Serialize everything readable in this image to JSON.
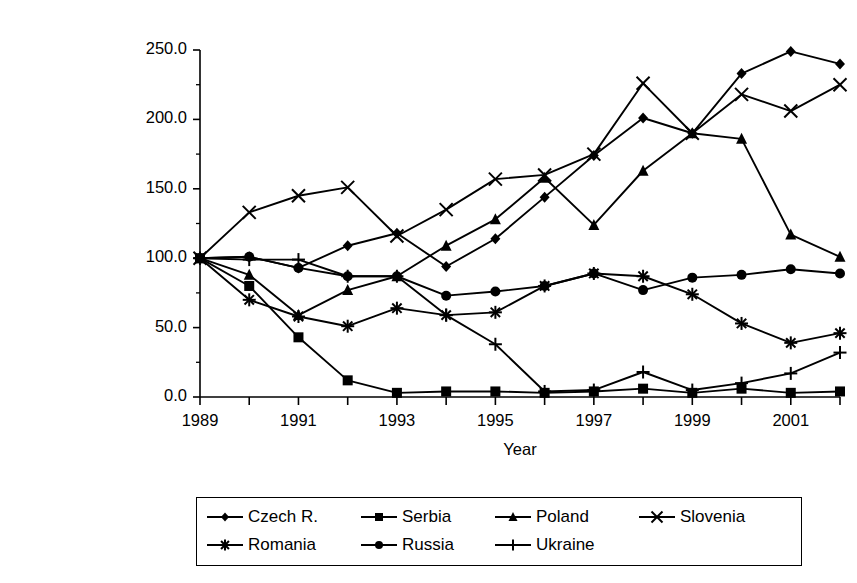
{
  "chart_data": {
    "type": "line",
    "title": "",
    "xlabel": "Year",
    "ylabel": "Index of passenger car production\n(1989 = 100)",
    "x": [
      1989,
      1990,
      1991,
      1992,
      1993,
      1994,
      1995,
      1996,
      1997,
      1998,
      1999,
      2000,
      2001,
      2002
    ],
    "xlim": [
      1989,
      2002
    ],
    "ylim": [
      0.0,
      250.0
    ],
    "xticks": [
      1989,
      1990,
      1991,
      1992,
      1993,
      1994,
      1995,
      1996,
      1997,
      1998,
      1999,
      2000,
      2001,
      2002
    ],
    "xtick_labels": [
      "1989",
      "",
      "1991",
      "",
      "1993",
      "",
      "1995",
      "",
      "1997",
      "",
      "1999",
      "",
      "2001",
      ""
    ],
    "yticks": [
      0.0,
      50.0,
      100.0,
      150.0,
      200.0,
      250.0
    ],
    "ytick_labels": [
      "0.0",
      "50.0",
      "100.0",
      "150.0",
      "200.0",
      "250.0"
    ],
    "grid": false,
    "legend_position": "below",
    "line_color": "#000000",
    "series": [
      {
        "name": "Czech R.",
        "marker": "diamond",
        "values": [
          100,
          101,
          93,
          109,
          118,
          94,
          114,
          144,
          174,
          201,
          190,
          233,
          249,
          240
        ]
      },
      {
        "name": "Serbia",
        "marker": "square",
        "values": [
          100,
          80,
          43,
          12,
          3,
          4,
          4,
          3,
          4,
          6,
          3,
          6,
          3,
          4
        ]
      },
      {
        "name": "Poland",
        "marker": "triangle",
        "values": [
          100,
          88,
          59,
          77,
          87,
          109,
          128,
          158,
          124,
          163,
          190,
          186,
          117,
          101
        ]
      },
      {
        "name": "Slovenia",
        "marker": "cross-x",
        "values": [
          100,
          133,
          145,
          151,
          116,
          135,
          157,
          160,
          175,
          226,
          190,
          218,
          206,
          225
        ]
      },
      {
        "name": "Romania",
        "marker": "asterisk",
        "values": [
          100,
          70,
          58,
          51,
          64,
          59,
          61,
          80,
          89,
          87,
          74,
          53,
          39,
          46
        ]
      },
      {
        "name": "Russia",
        "marker": "circle",
        "values": [
          100,
          101,
          93,
          87,
          87,
          73,
          76,
          80,
          89,
          77,
          86,
          88,
          92,
          89
        ]
      },
      {
        "name": "Ukraine",
        "marker": "plus",
        "values": [
          100,
          99,
          99,
          87,
          87,
          59,
          38,
          4,
          5,
          18,
          5,
          10,
          17,
          32
        ]
      }
    ]
  },
  "legend": {
    "rows": [
      [
        "Czech R.",
        "Serbia",
        "Poland",
        "Slovenia"
      ],
      [
        "Romania",
        "Russia",
        "Ukraine"
      ]
    ]
  }
}
